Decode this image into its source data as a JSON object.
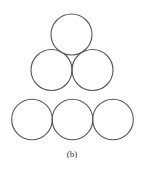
{
  "figure": {
    "caption": "(b)",
    "groups": [
      {
        "name": "triangle",
        "count": 3
      },
      {
        "name": "row",
        "count": 3
      }
    ],
    "stroke_color": "#555555"
  }
}
